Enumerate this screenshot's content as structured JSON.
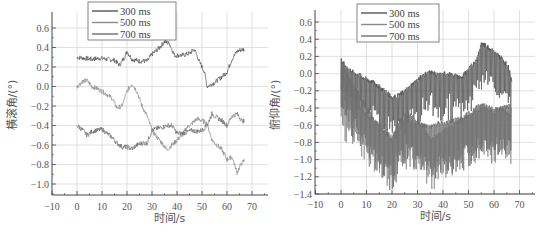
{
  "chart_data": [
    {
      "type": "line",
      "title": "",
      "xlabel": "时间/s",
      "ylabel": "横滚角/(°)",
      "xlim": [
        -10,
        75
      ],
      "ylim": [
        -1.1,
        0.7
      ],
      "xticks": [
        -10,
        0,
        10,
        20,
        30,
        40,
        50,
        60,
        70
      ],
      "xtick_labels": [
        "−10",
        "0",
        "10",
        "20",
        "30",
        "40",
        "50",
        "60",
        "70"
      ],
      "yticks": [
        0.6,
        0.4,
        0.2,
        0.0,
        -0.2,
        -0.4,
        -0.6,
        -0.8,
        -1.0
      ],
      "ytick_labels": [
        "0.6",
        "0.4",
        "0.2",
        "0.0",
        "−0.2",
        "−0.4",
        "−0.6",
        "−0.8",
        "−1.0"
      ],
      "grid": true,
      "legend_position": "upper-left",
      "series": [
        {
          "name": "300 ms",
          "color": "#555555",
          "x": [
            0,
            3,
            6,
            9,
            12,
            15,
            17,
            19,
            20,
            22,
            25,
            28,
            30,
            33,
            35,
            37,
            39,
            42,
            45,
            47,
            49,
            51,
            52,
            55,
            58,
            60,
            62,
            64,
            66,
            67
          ],
          "y": [
            0.3,
            0.29,
            0.28,
            0.29,
            0.28,
            0.27,
            0.22,
            0.3,
            0.36,
            0.28,
            0.26,
            0.26,
            0.33,
            0.4,
            0.46,
            0.44,
            0.32,
            0.32,
            0.34,
            0.38,
            0.25,
            0.15,
            0.0,
            0.04,
            0.1,
            0.15,
            0.28,
            0.36,
            0.38,
            0.38
          ]
        },
        {
          "name": "500 ms",
          "color": "#8a8a8a",
          "x": [
            0,
            2,
            4,
            6,
            8,
            10,
            12,
            14,
            16,
            18,
            20,
            22,
            24,
            26,
            28,
            30,
            32,
            34,
            36,
            38,
            40,
            42,
            44,
            46,
            48,
            50,
            52,
            54,
            56,
            58,
            60,
            62,
            64,
            66,
            67
          ],
          "y": [
            0.0,
            0.05,
            0.06,
            0.0,
            -0.02,
            -0.05,
            -0.08,
            -0.12,
            -0.22,
            -0.2,
            -0.05,
            0.03,
            -0.05,
            -0.2,
            -0.3,
            -0.45,
            -0.52,
            -0.58,
            -0.65,
            -0.6,
            -0.55,
            -0.5,
            -0.42,
            -0.38,
            -0.33,
            -0.35,
            -0.38,
            -0.55,
            -0.6,
            -0.65,
            -0.75,
            -0.72,
            -0.88,
            -0.78,
            -0.76
          ]
        },
        {
          "name": "700 ms",
          "color": "#6e6e6e",
          "x": [
            0,
            2,
            4,
            6,
            8,
            10,
            12,
            14,
            16,
            18,
            20,
            22,
            24,
            26,
            28,
            30,
            32,
            34,
            36,
            38,
            40,
            42,
            44,
            46,
            48,
            50,
            52,
            54,
            56,
            58,
            60,
            62,
            64,
            66,
            67
          ],
          "y": [
            -0.4,
            -0.44,
            -0.5,
            -0.46,
            -0.45,
            -0.44,
            -0.48,
            -0.52,
            -0.58,
            -0.62,
            -0.62,
            -0.64,
            -0.6,
            -0.58,
            -0.58,
            -0.45,
            -0.43,
            -0.42,
            -0.4,
            -0.4,
            -0.48,
            -0.48,
            -0.47,
            -0.45,
            -0.46,
            -0.45,
            -0.4,
            -0.28,
            -0.32,
            -0.35,
            -0.4,
            -0.3,
            -0.28,
            -0.35,
            -0.36
          ]
        }
      ]
    },
    {
      "type": "line",
      "title": "",
      "xlabel": "时间/s",
      "ylabel": "俯仰角/(°)",
      "xlim": [
        -10,
        75
      ],
      "ylim": [
        -1.4,
        0.7
      ],
      "xticks": [
        -10,
        0,
        10,
        20,
        30,
        40,
        50,
        60,
        70
      ],
      "xtick_labels": [
        "−10",
        "0",
        "10",
        "20",
        "30",
        "40",
        "50",
        "60",
        "70"
      ],
      "yticks": [
        0.6,
        0.4,
        0.2,
        0.0,
        -0.2,
        -0.4,
        -0.6,
        -0.8,
        -1.0,
        -1.2,
        -1.4
      ],
      "ytick_labels": [
        "0.6",
        "0.4",
        "0.2",
        "0.0",
        "−0.2",
        "−0.4",
        "−0.6",
        "−0.8",
        "−1.0",
        "−1.2",
        "−1.4"
      ],
      "grid": true,
      "legend_position": "upper-left",
      "series": [
        {
          "name": "300 ms",
          "color": "#555555",
          "x": [
            0,
            3,
            6,
            9,
            12,
            15,
            18,
            20,
            23,
            26,
            29,
            32,
            35,
            38,
            41,
            44,
            47,
            50,
            53,
            55,
            57,
            60,
            63,
            66,
            67
          ],
          "y": [
            0.15,
            0.05,
            0.0,
            -0.05,
            -0.1,
            -0.15,
            -0.22,
            -0.28,
            -0.25,
            -0.18,
            -0.1,
            -0.02,
            0.02,
            -0.02,
            0.0,
            -0.02,
            -0.05,
            0.05,
            0.15,
            0.35,
            0.32,
            0.25,
            0.18,
            0.05,
            -0.1
          ]
        },
        {
          "name": "500 ms",
          "color": "#8a8a8a",
          "x": [
            0,
            3,
            6,
            9,
            12,
            15,
            18,
            20,
            23,
            26,
            29,
            32,
            35,
            38,
            41,
            44,
            47,
            50,
            53,
            55,
            57,
            60,
            63,
            66,
            67
          ],
          "y": [
            -0.15,
            -0.25,
            -0.35,
            -0.45,
            -0.55,
            -0.62,
            -0.7,
            -0.72,
            -0.62,
            -0.55,
            -0.58,
            -0.6,
            -0.78,
            -0.72,
            -0.65,
            -0.6,
            -0.55,
            -0.45,
            -0.45,
            -0.4,
            -0.42,
            -0.45,
            -0.4,
            -0.48,
            -0.48
          ]
        },
        {
          "name": "700 ms",
          "color": "#6e6e6e",
          "x": [
            0,
            3,
            6,
            9,
            12,
            15,
            18,
            20,
            23,
            26,
            29,
            32,
            35,
            38,
            41,
            44,
            47,
            50,
            53,
            55,
            57,
            60,
            63,
            66,
            67
          ],
          "y": [
            0.1,
            -0.05,
            -0.2,
            -0.35,
            -0.5,
            -0.6,
            -0.7,
            -0.78,
            -0.55,
            -0.45,
            -0.55,
            -0.6,
            -0.62,
            -0.58,
            -0.58,
            -0.55,
            -0.52,
            -0.5,
            -0.4,
            -0.35,
            -0.38,
            -0.42,
            -0.4,
            -0.38,
            -0.4
          ]
        }
      ]
    }
  ]
}
